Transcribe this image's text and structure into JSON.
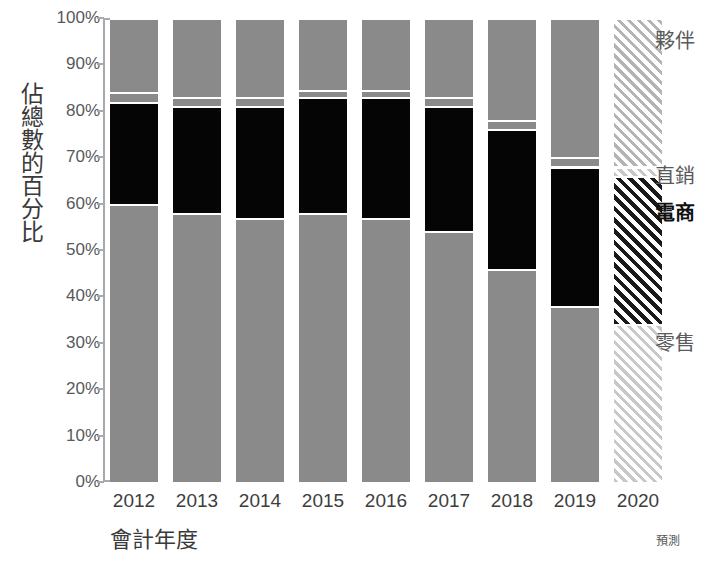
{
  "chart_data": {
    "type": "bar",
    "stacked": true,
    "stacked_normalized": true,
    "title": "",
    "xlabel": "會計年度",
    "ylabel": "佔總數的百分比",
    "ylim": [
      0,
      100
    ],
    "ytick_labels": [
      "0%",
      "10%",
      "20%",
      "30%",
      "40%",
      "50%",
      "60%",
      "70%",
      "80%",
      "90%",
      "100%"
    ],
    "ytick_values": [
      0,
      10,
      20,
      30,
      40,
      50,
      60,
      70,
      80,
      90,
      100
    ],
    "grid": false,
    "legend_position": "right-inline",
    "categories": [
      "2012",
      "2013",
      "2014",
      "2015",
      "2016",
      "2017",
      "2018",
      "2019",
      "2020"
    ],
    "forecast_categories": [
      "2020"
    ],
    "forecast_note": "預測",
    "series": [
      {
        "name": "零售",
        "key": "retail",
        "color": "#8a8a8a",
        "values": [
          60,
          58,
          57,
          58,
          57,
          54,
          46,
          38,
          34
        ]
      },
      {
        "name": "電商",
        "key": "ecommerce",
        "color": "#050505",
        "emphasis": true,
        "values": [
          22,
          23,
          24,
          25,
          26,
          27,
          30,
          30,
          32
        ]
      },
      {
        "name": "直銷",
        "key": "direct",
        "color": "#8a8a8a",
        "values": [
          2,
          2,
          2,
          1.5,
          1.5,
          2,
          2,
          2,
          2
        ]
      },
      {
        "name": "夥伴",
        "key": "partner",
        "color": "#8a8a8a",
        "values": [
          16,
          17,
          17,
          15.5,
          15.5,
          17,
          22,
          30,
          32
        ]
      }
    ],
    "legend": [
      {
        "label": "夥伴",
        "y_percent": 95,
        "emphasis": false
      },
      {
        "label": "直銷",
        "y_percent": 66,
        "emphasis": false
      },
      {
        "label": "電商",
        "y_percent": 58,
        "emphasis": true
      },
      {
        "label": "零售",
        "y_percent": 30,
        "emphasis": false
      }
    ]
  }
}
